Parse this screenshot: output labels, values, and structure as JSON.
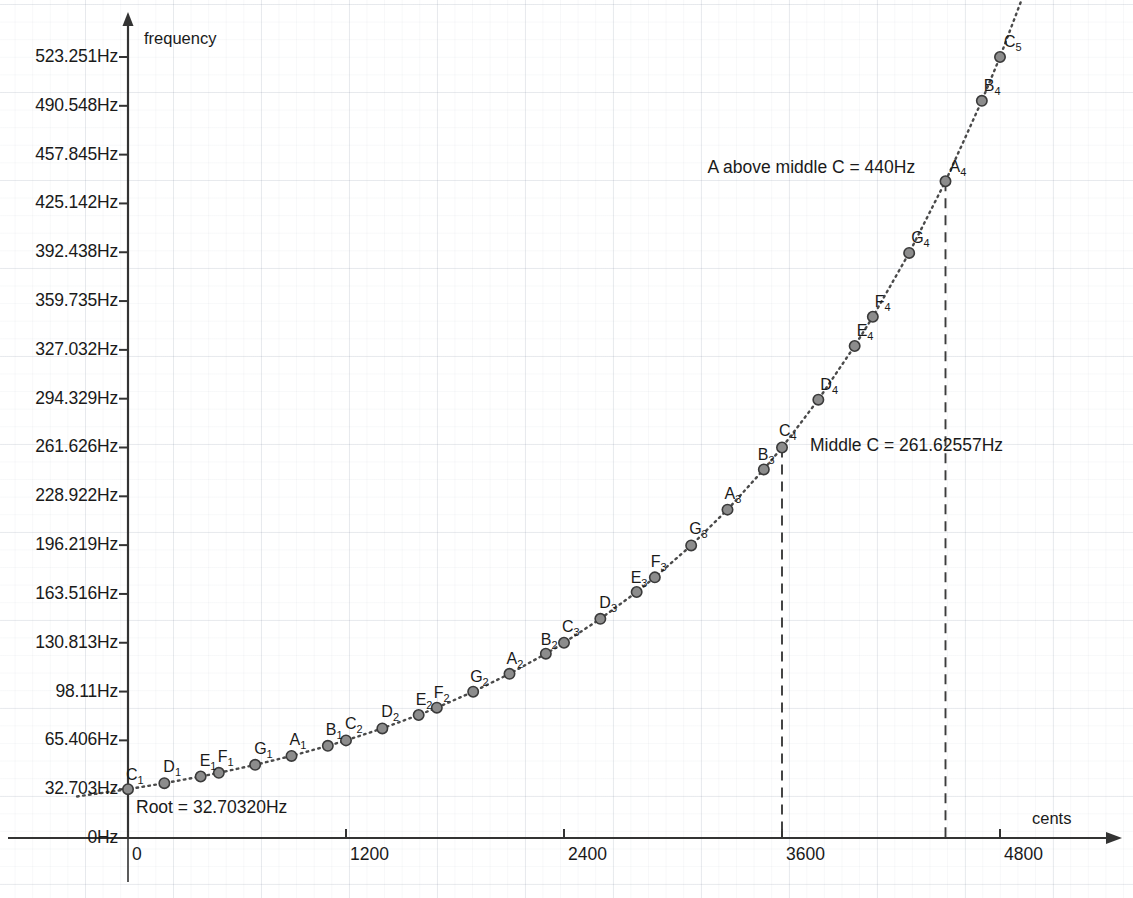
{
  "chart_data": {
    "type": "scatter",
    "title": "",
    "xlabel": "cents",
    "ylabel": "frequency",
    "xlim": [
      -300,
      5000
    ],
    "ylim": [
      0,
      545
    ],
    "grid": true,
    "legend": "none",
    "x_ticks": [
      {
        "value": 0,
        "label": "0"
      },
      {
        "value": 1200,
        "label": "1200"
      },
      {
        "value": 2400,
        "label": "2400"
      },
      {
        "value": 3600,
        "label": "3600"
      },
      {
        "value": 4800,
        "label": "4800"
      }
    ],
    "y_ticks": [
      {
        "value": 523.251,
        "label": "523.251Hz"
      },
      {
        "value": 490.548,
        "label": "490.548Hz"
      },
      {
        "value": 457.845,
        "label": "457.845Hz"
      },
      {
        "value": 425.142,
        "label": "425.142Hz"
      },
      {
        "value": 392.438,
        "label": "392.438Hz"
      },
      {
        "value": 359.735,
        "label": "359.735Hz"
      },
      {
        "value": 327.032,
        "label": "327.032Hz"
      },
      {
        "value": 294.329,
        "label": "294.329Hz"
      },
      {
        "value": 261.626,
        "label": "261.626Hz"
      },
      {
        "value": 228.922,
        "label": "228.922Hz"
      },
      {
        "value": 196.219,
        "label": "196.219Hz"
      },
      {
        "value": 163.516,
        "label": "163.516Hz"
      },
      {
        "value": 130.813,
        "label": "130.813Hz"
      },
      {
        "value": 98.11,
        "label": "98.11Hz"
      },
      {
        "value": 65.406,
        "label": "65.406Hz"
      },
      {
        "value": 32.703,
        "label": "32.703Hz"
      },
      {
        "value": 0,
        "label": "0Hz"
      }
    ],
    "points": [
      {
        "note": "C",
        "octave": "1",
        "cents": 0,
        "freq": 32.703,
        "label_dx": -2,
        "label_dy": -22
      },
      {
        "note": "D",
        "octave": "1",
        "cents": 200,
        "freq": 36.708,
        "label_dx": -1,
        "label_dy": -24
      },
      {
        "note": "E",
        "octave": "1",
        "cents": 400,
        "freq": 41.203,
        "label_dx": -1,
        "label_dy": -24
      },
      {
        "note": "F",
        "octave": "1",
        "cents": 500,
        "freq": 43.654,
        "label_dx": -1,
        "label_dy": -24
      },
      {
        "note": "G",
        "octave": "1",
        "cents": 700,
        "freq": 48.999,
        "label_dx": -1,
        "label_dy": -24
      },
      {
        "note": "A",
        "octave": "1",
        "cents": 900,
        "freq": 55.0,
        "label_dx": -2,
        "label_dy": -24
      },
      {
        "note": "B",
        "octave": "1",
        "cents": 1100,
        "freq": 61.735,
        "label_dx": -2,
        "label_dy": -24
      },
      {
        "note": "C",
        "octave": "2",
        "cents": 1200,
        "freq": 65.406,
        "label_dx": -1,
        "label_dy": -24
      },
      {
        "note": "D",
        "octave": "2",
        "cents": 1400,
        "freq": 73.416,
        "label_dx": -1,
        "label_dy": -24
      },
      {
        "note": "E",
        "octave": "2",
        "cents": 1600,
        "freq": 82.407,
        "label_dx": -3,
        "label_dy": -23
      },
      {
        "note": "F",
        "octave": "2",
        "cents": 1700,
        "freq": 87.307,
        "label_dx": -3,
        "label_dy": -23
      },
      {
        "note": "G",
        "octave": "2",
        "cents": 1900,
        "freq": 97.999,
        "label_dx": -3,
        "label_dy": -23
      },
      {
        "note": "A",
        "octave": "2",
        "cents": 2100,
        "freq": 110.0,
        "label_dx": -3,
        "label_dy": -23
      },
      {
        "note": "B",
        "octave": "2",
        "cents": 2300,
        "freq": 123.471,
        "label_dx": -5,
        "label_dy": -22
      },
      {
        "note": "C",
        "octave": "3",
        "cents": 2400,
        "freq": 130.813,
        "label_dx": -2,
        "label_dy": -24
      },
      {
        "note": "D",
        "octave": "3",
        "cents": 2600,
        "freq": 146.832,
        "label_dx": -1,
        "label_dy": -24
      },
      {
        "note": "E",
        "octave": "3",
        "cents": 2800,
        "freq": 164.814,
        "label_dx": -6,
        "label_dy": -22
      },
      {
        "note": "F",
        "octave": "3",
        "cents": 2900,
        "freq": 174.614,
        "label_dx": -4,
        "label_dy": -23
      },
      {
        "note": "G",
        "octave": "3",
        "cents": 3100,
        "freq": 195.998,
        "label_dx": -2,
        "label_dy": -24
      },
      {
        "note": "A",
        "octave": "3",
        "cents": 3300,
        "freq": 220.0,
        "label_dx": -3,
        "label_dy": -24
      },
      {
        "note": "B",
        "octave": "3",
        "cents": 3500,
        "freq": 246.942,
        "label_dx": -6,
        "label_dy": -22
      },
      {
        "note": "C",
        "octave": "4",
        "cents": 3600,
        "freq": 261.626,
        "label_dx": -3,
        "label_dy": -24
      },
      {
        "note": "D",
        "octave": "4",
        "cents": 3800,
        "freq": 293.665,
        "label_dx": 2,
        "label_dy": -23
      },
      {
        "note": "E",
        "octave": "4",
        "cents": 4000,
        "freq": 329.628,
        "label_dx": 2,
        "label_dy": -23
      },
      {
        "note": "F",
        "octave": "4",
        "cents": 4100,
        "freq": 349.228,
        "label_dx": 2,
        "label_dy": -23
      },
      {
        "note": "G",
        "octave": "4",
        "cents": 4300,
        "freq": 391.995,
        "label_dx": 2,
        "label_dy": -23
      },
      {
        "note": "A",
        "octave": "4",
        "cents": 4500,
        "freq": 440.0,
        "label_dx": 4,
        "label_dy": -22
      },
      {
        "note": "B",
        "octave": "4",
        "cents": 4700,
        "freq": 493.883,
        "label_dx": 2,
        "label_dy": -23
      },
      {
        "note": "C",
        "octave": "5",
        "cents": 4800,
        "freq": 523.251,
        "label_dx": 4,
        "label_dy": -23
      }
    ],
    "annotations": [
      {
        "id": "root",
        "text": "Root = 32.70320Hz",
        "cents": 0,
        "freq": 32.703
      },
      {
        "id": "middle-c",
        "text": "Middle C = 261.62557Hz",
        "cents": 3600,
        "freq": 261.626
      },
      {
        "id": "a440",
        "text": "A above middle C = 440Hz",
        "cents": 4500,
        "freq": 440.0
      }
    ],
    "reference_lines": [
      {
        "id": "middle-c-line",
        "cents": 3600,
        "style": "dashed"
      },
      {
        "id": "a440-line",
        "cents": 4500,
        "style": "dashed"
      }
    ]
  },
  "colors": {
    "axis": "#333333",
    "point_fill": "#8c8c8c",
    "point_stroke": "#3a3a3a",
    "curve": "#4a4a4a",
    "grid": "#c3cbd6",
    "text": "#1a1a1a"
  }
}
